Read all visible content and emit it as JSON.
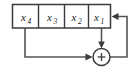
{
  "figure": {
    "name": "linear-feedback-shift-register",
    "background_color": "#ffffff",
    "line_color": "#545454",
    "outline_color": "#3b3b3b",
    "text_color": "#1a1a1a"
  },
  "register": {
    "cells": [
      {
        "base": "x",
        "subscript": "4",
        "full": "x4"
      },
      {
        "base": "x",
        "subscript": "3",
        "full": "x3"
      },
      {
        "base": "x",
        "subscript": "2",
        "full": "x2"
      },
      {
        "base": "x",
        "subscript": "1",
        "full": "x1"
      }
    ]
  },
  "adder": {
    "symbol": "+",
    "name": "modulo-2-adder"
  },
  "wires": {
    "tap_from": "x4",
    "tap_to": "adder",
    "output_from": "x1",
    "output_to": "adder",
    "feedback_from": "adder",
    "feedback_to": "x1"
  }
}
